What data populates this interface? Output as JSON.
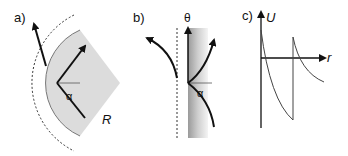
{
  "panels": {
    "a": {
      "label": "a)",
      "angle_symbol": "α",
      "radius_symbol": "R"
    },
    "b": {
      "label": "b)",
      "axis_symbol": "θ",
      "angle_symbol": "α"
    },
    "c": {
      "label": "c)",
      "y_axis_symbol": "U",
      "x_axis_symbol": "r"
    }
  },
  "colors": {
    "stroke": "#111111",
    "wedge_fill": "#dcdcdc",
    "thin_line": "#777777"
  }
}
